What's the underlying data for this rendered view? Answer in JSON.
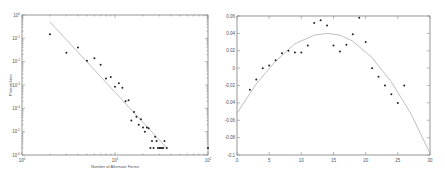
{
  "chart_data": [
    {
      "type": "scatter",
      "title": "",
      "xlabel": "Number of Alternate Forms",
      "ylabel": "Probabilities",
      "xscale": "log",
      "yscale": "log",
      "xlim": [
        1,
        100
      ],
      "ylim": [
        1e-06,
        1
      ],
      "xticks": [
        "10^0",
        "10^1",
        "10^2"
      ],
      "yticks": [
        "10^0",
        "10^-1",
        "10^-2",
        "10^-3",
        "10^-4",
        "10^-5",
        "10^-6"
      ],
      "grid": false,
      "series": [
        {
          "name": "observed",
          "style": "points",
          "x": [
            2,
            3,
            4,
            5,
            6,
            7,
            8,
            9,
            10,
            11,
            12,
            13,
            14,
            15,
            16,
            17,
            18,
            19,
            20,
            21,
            22,
            23,
            24,
            25,
            26,
            27,
            28,
            29,
            30,
            31,
            32,
            33,
            34,
            36,
            100
          ],
          "y": [
            0.15,
            0.024,
            0.04,
            0.011,
            0.014,
            0.0074,
            0.0019,
            0.0022,
            0.00085,
            0.0012,
            0.00077,
            0.0002,
            0.00022,
            3e-05,
            7e-05,
            4.4e-05,
            2e-05,
            3.4e-05,
            1.5e-05,
            1e-05,
            1.5e-05,
            1.4e-05,
            2e-06,
            4e-06,
            2e-06,
            6e-06,
            4e-06,
            2e-06,
            2e-06,
            2e-06,
            2e-06,
            2e-06,
            4e-06,
            2e-06,
            2e-06
          ]
        },
        {
          "name": "power-law fit",
          "style": "line",
          "x": [
            2,
            36
          ],
          "y": [
            0.5,
            2e-06
          ]
        }
      ]
    },
    {
      "type": "scatter",
      "title": "",
      "xlabel": "",
      "ylabel": "",
      "xlim": [
        0,
        30
      ],
      "ylim": [
        -0.1,
        0.06
      ],
      "xticks": [
        0,
        5,
        10,
        15,
        20,
        25,
        30
      ],
      "yticks": [
        0.06,
        0.04,
        0.02,
        0,
        -0.02,
        -0.04,
        -0.06,
        -0.08,
        -0.1
      ],
      "grid": false,
      "series": [
        {
          "name": "observed",
          "style": "points",
          "x": [
            2,
            3,
            4,
            5,
            6,
            7,
            8,
            9,
            10,
            11,
            12,
            13,
            14,
            15,
            16,
            17,
            18,
            19,
            20,
            21,
            22,
            23,
            24,
            25,
            26
          ],
          "y": [
            -0.025,
            -0.013,
            0.0,
            0.003,
            0.009,
            0.017,
            0.02,
            0.018,
            0.018,
            0.026,
            0.052,
            0.055,
            0.049,
            0.026,
            0.019,
            0.027,
            0.039,
            0.058,
            0.03,
            0.0,
            -0.01,
            -0.02,
            -0.03,
            -0.04,
            -0.02
          ]
        },
        {
          "name": "quadratic fit",
          "style": "line",
          "x": [
            0,
            3,
            6,
            9,
            12,
            14,
            16,
            18,
            21,
            24,
            27,
            30
          ],
          "y": [
            -0.052,
            -0.018,
            0.008,
            0.028,
            0.038,
            0.04,
            0.038,
            0.031,
            0.012,
            -0.016,
            -0.052,
            -0.098
          ]
        }
      ]
    }
  ]
}
